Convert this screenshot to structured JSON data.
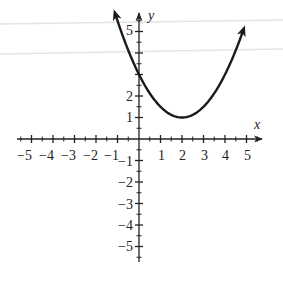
{
  "chart_data": {
    "type": "line",
    "title": "",
    "xlabel": "x",
    "ylabel": "y",
    "xlim": [
      -5,
      5
    ],
    "ylim": [
      -5,
      5
    ],
    "grid": false,
    "x_ticks": [
      -5,
      -4,
      -3,
      -2,
      -1,
      1,
      2,
      3,
      4,
      5
    ],
    "y_ticks_labeled": [
      5,
      2,
      1,
      -1,
      -2,
      -3,
      -4,
      -5
    ],
    "x_tick_labels": [
      "−5",
      "−4",
      "−3",
      "−2",
      "−1",
      "1",
      "2",
      "3",
      "4",
      "5"
    ],
    "y_tick_labels": [
      "5",
      "2",
      "1",
      "−1",
      "−2",
      "−3",
      "−4",
      "−5"
    ],
    "series": [
      {
        "name": "parabola",
        "equation": "y = 0.5(x - 2)^2 + 1",
        "vertex": [
          2,
          1
        ],
        "x": [
          -1,
          0,
          1,
          2,
          3,
          4,
          5
        ],
        "y": [
          5.5,
          3,
          1.5,
          1,
          1.5,
          3,
          5.5
        ],
        "arrows_both_ends": true
      }
    ]
  },
  "labels": {
    "x_axis": "x",
    "y_axis": "y",
    "xt": [
      "−5",
      "−4",
      "−3",
      "−2",
      "−1",
      "1",
      "2",
      "3",
      "4",
      "5"
    ],
    "yt": [
      "5",
      "2",
      "1",
      "−1",
      "−2",
      "−3",
      "−4",
      "−5"
    ]
  }
}
